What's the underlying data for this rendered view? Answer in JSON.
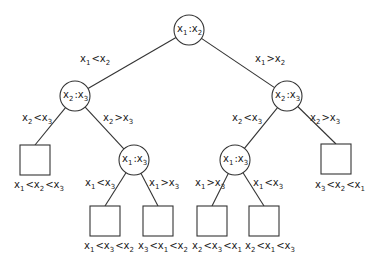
{
  "diagram": {
    "type": "decision-tree",
    "colors": {
      "stroke": "#333333",
      "text": "#222222",
      "background": "#ffffff"
    },
    "internal_nodes": [
      {
        "id": "root",
        "label": "x1:x2",
        "a": "1",
        "b": "2",
        "cx": 189,
        "cy": 30
      },
      {
        "id": "L",
        "label": "x2:x3",
        "a": "2",
        "b": "3",
        "cx": 75,
        "cy": 96
      },
      {
        "id": "R",
        "label": "x2:x3",
        "a": "2",
        "b": "3",
        "cx": 287,
        "cy": 96
      },
      {
        "id": "LR",
        "label": "x1:x3",
        "a": "1",
        "b": "3",
        "cx": 134,
        "cy": 160
      },
      {
        "id": "RL",
        "label": "x1:x3",
        "a": "1",
        "b": "3",
        "cx": 235,
        "cy": 160
      }
    ],
    "edges": [
      {
        "from": "root",
        "to": "L",
        "label": "x1 < x2",
        "a": "1",
        "op": "<",
        "b": "2",
        "lx": 80,
        "ly": 62
      },
      {
        "from": "root",
        "to": "R",
        "label": "x1 > x2",
        "a": "1",
        "op": ">",
        "b": "2",
        "lx": 255,
        "ly": 62
      },
      {
        "from": "L",
        "to": "leaf1",
        "label": "x2 < x3",
        "a": "2",
        "op": "<",
        "b": "3",
        "lx": 22,
        "ly": 121
      },
      {
        "from": "L",
        "to": "LR",
        "label": "x2 > x3",
        "a": "2",
        "op": ">",
        "b": "3",
        "lx": 103,
        "ly": 121
      },
      {
        "from": "R",
        "to": "RL",
        "label": "x2 < x3",
        "a": "2",
        "op": "<",
        "b": "3",
        "lx": 232,
        "ly": 121
      },
      {
        "from": "R",
        "to": "leaf6",
        "label": "x2 > x3",
        "a": "2",
        "op": ">",
        "b": "3",
        "lx": 310,
        "ly": 121
      },
      {
        "from": "LR",
        "to": "leaf2",
        "label": "x1 < x3",
        "a": "1",
        "op": "<",
        "b": "3",
        "lx": 85,
        "ly": 186
      },
      {
        "from": "LR",
        "to": "leaf3",
        "label": "x1 > x3",
        "a": "1",
        "op": ">",
        "b": "3",
        "lx": 149,
        "ly": 186
      },
      {
        "from": "RL",
        "to": "leaf4",
        "label": "x1 > x3",
        "a": "1",
        "op": ">",
        "b": "3",
        "lx": 195,
        "ly": 186
      },
      {
        "from": "RL",
        "to": "leaf5",
        "label": "x1 < x3",
        "a": "1",
        "op": "<",
        "b": "3",
        "lx": 253,
        "ly": 186
      }
    ],
    "leaves": [
      {
        "id": "leaf1",
        "label": "x1 < x2 < x3",
        "order": [
          "1",
          "2",
          "3"
        ],
        "x": 20,
        "y": 145,
        "lx": 14,
        "ly": 188
      },
      {
        "id": "leaf2",
        "label": "x1 < x3 < x2",
        "order": [
          "1",
          "3",
          "2"
        ],
        "x": 90,
        "y": 206,
        "lx": 84,
        "ly": 249
      },
      {
        "id": "leaf3",
        "label": "x3 < x1 < x2",
        "order": [
          "3",
          "1",
          "2"
        ],
        "x": 143,
        "y": 206,
        "lx": 138,
        "ly": 249
      },
      {
        "id": "leaf4",
        "label": "x2 < x3 < x1",
        "order": [
          "2",
          "3",
          "1"
        ],
        "x": 197,
        "y": 206,
        "lx": 192,
        "ly": 249
      },
      {
        "id": "leaf5",
        "label": "x2 < x1 < x3",
        "order": [
          "2",
          "1",
          "3"
        ],
        "x": 249,
        "y": 206,
        "lx": 245,
        "ly": 249
      },
      {
        "id": "leaf6",
        "label": "x3 < x2 < x1",
        "order": [
          "3",
          "2",
          "1"
        ],
        "x": 321,
        "y": 144,
        "lx": 315,
        "ly": 188
      }
    ]
  }
}
